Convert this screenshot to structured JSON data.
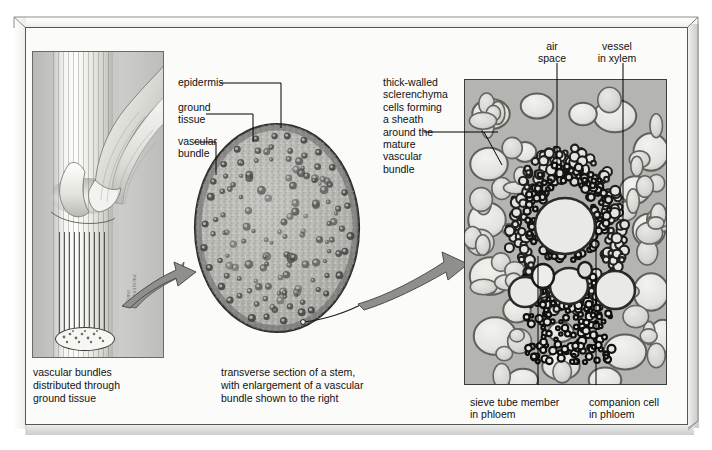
{
  "figure": {
    "background_color": "#fbfbfa",
    "frame_color": "#575755",
    "arrow_color": "#8c8c8a",
    "text_color": "#111111"
  },
  "left_panel": {
    "name": "stem-with-leaf-sheath-drawing",
    "caption": "vascular bundles\ndistributed through\nground tissue",
    "caption_lines": [
      "vascular bundles",
      "distributed through",
      "ground tissue"
    ],
    "artist_signature": "Tomo Narashima"
  },
  "center_panel": {
    "name": "stem-transverse-section",
    "caption_lines": [
      "transverse section of a stem,",
      "with enlargement of a vascular",
      "bundle shown to the right"
    ],
    "labels": [
      {
        "id": "epidermis",
        "text": "epidermis"
      },
      {
        "id": "ground-tissue",
        "text": "ground\ntissue",
        "lines": [
          "ground",
          "tissue"
        ]
      },
      {
        "id": "vascular-bundle",
        "text": "vascular\nbundle",
        "lines": [
          "vascular",
          "bundle"
        ]
      }
    ]
  },
  "right_panel": {
    "name": "vascular-bundle-micrograph",
    "labels": [
      {
        "id": "air-space",
        "lines": [
          "air",
          "space"
        ]
      },
      {
        "id": "vessel-xylem",
        "lines": [
          "vessel",
          "in xylem"
        ]
      },
      {
        "id": "sclerenchyma",
        "lines": [
          "thick-walled",
          "sclerenchyma",
          "cells forming",
          "a sheath",
          "around the",
          "mature",
          "vascular",
          "bundle"
        ]
      },
      {
        "id": "sieve-tube",
        "lines": [
          "sieve tube member",
          "in phloem"
        ]
      },
      {
        "id": "companion-cell",
        "lines": [
          "companion cell",
          "in phloem"
        ]
      }
    ]
  },
  "arrows": [
    {
      "id": "arrow-stem-to-section",
      "from": "left-panel",
      "to": "center-panel"
    },
    {
      "id": "arrow-section-to-bundle",
      "from": "center-panel",
      "to": "right-panel"
    }
  ]
}
